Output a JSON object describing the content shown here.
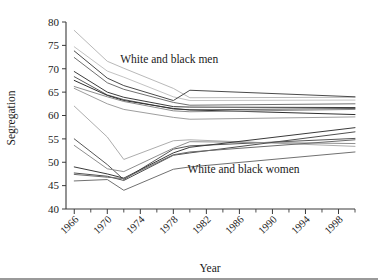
{
  "chart_data": {
    "type": "line",
    "title": "",
    "xlabel": "Year",
    "ylabel": "Segregation",
    "xlim": [
      1965,
      2000
    ],
    "ylim": [
      40,
      80
    ],
    "yticks": [
      40,
      45,
      50,
      55,
      60,
      65,
      70,
      75,
      80
    ],
    "xticks": [
      1966,
      1970,
      1974,
      1978,
      1982,
      1986,
      1990,
      1994,
      1998
    ],
    "xminor_step": 2,
    "grid": false,
    "legend": "none",
    "annotations": [
      {
        "text": "White and black men",
        "x": 1977.5,
        "y": 71.2
      },
      {
        "text": "White and black women",
        "x": 1986.5,
        "y": 47.6
      }
    ],
    "x": [
      1966,
      1970,
      1972,
      1978,
      1980,
      2000
    ],
    "series": [
      {
        "name": "men-1",
        "group": "White and black men",
        "color": "#b9b9b9",
        "width": 1.0,
        "values": [
          78.2,
          71.6,
          70.1,
          65.8,
          63.8,
          63.9
        ]
      },
      {
        "name": "men-2",
        "group": "White and black men",
        "color": "#c3c3c3",
        "width": 1.0,
        "values": [
          74.7,
          69.5,
          68.2,
          64.0,
          63.2,
          63.3
        ]
      },
      {
        "name": "men-3",
        "group": "White and black men",
        "color": "#4a4a4a",
        "width": 1.0,
        "values": [
          73.8,
          68.0,
          66.4,
          63.2,
          65.4,
          64.0
        ]
      },
      {
        "name": "men-4",
        "group": "White and black men",
        "color": "#707070",
        "width": 1.0,
        "values": [
          72.4,
          67.0,
          65.6,
          62.8,
          62.2,
          62.5
        ]
      },
      {
        "name": "men-5",
        "group": "White and black men",
        "color": "#3d3d3d",
        "width": 1.0,
        "values": [
          69.4,
          65.0,
          63.9,
          61.9,
          61.8,
          61.7
        ]
      },
      {
        "name": "men-6",
        "group": "White and black men",
        "color": "#5a5a5a",
        "width": 1.0,
        "values": [
          68.3,
          64.4,
          63.4,
          61.4,
          61.2,
          61.5
        ]
      },
      {
        "name": "men-7",
        "group": "White and black men",
        "color": "#2f2f2f",
        "width": 1.0,
        "values": [
          67.5,
          64.3,
          63.2,
          61.5,
          61.2,
          60.2
        ]
      },
      {
        "name": "men-8",
        "group": "White and black men",
        "color": "#8c8c8c",
        "width": 1.0,
        "values": [
          66.2,
          64.0,
          63.0,
          61.0,
          60.8,
          61.3
        ]
      },
      {
        "name": "men-9",
        "group": "White and black men",
        "color": "#9e9e9e",
        "width": 1.0,
        "values": [
          65.8,
          62.5,
          61.3,
          59.6,
          59.2,
          59.7
        ]
      },
      {
        "name": "men-10",
        "group": "White and black men",
        "color": "#adadad",
        "width": 1.0,
        "values": [
          62.0,
          55.4,
          50.6,
          54.6,
          54.8,
          53.4
        ]
      },
      {
        "name": "women-1",
        "group": "White and black women",
        "color": "#565656",
        "width": 1.0,
        "values": [
          55.0,
          49.5,
          46.3,
          52.8,
          53.5,
          55.1
        ]
      },
      {
        "name": "women-2",
        "group": "White and black women",
        "color": "#8f8f8f",
        "width": 1.0,
        "values": [
          53.6,
          48.6,
          48.0,
          53.0,
          54.4,
          54.0
        ]
      },
      {
        "name": "women-3",
        "group": "White and black women",
        "color": "#3a3a3a",
        "width": 1.0,
        "values": [
          49.0,
          47.5,
          46.6,
          52.0,
          53.2,
          57.4
        ]
      },
      {
        "name": "women-4",
        "group": "White and black women",
        "color": "#4f4f4f",
        "width": 1.0,
        "values": [
          47.7,
          47.0,
          46.1,
          51.5,
          52.0,
          56.5
        ]
      },
      {
        "name": "women-5",
        "group": "White and black women",
        "color": "#6b6b6b",
        "width": 1.0,
        "values": [
          47.4,
          46.8,
          46.5,
          51.6,
          52.2,
          54.8
        ]
      },
      {
        "name": "women-6",
        "group": "White and black women",
        "color": "#717171",
        "width": 1.0,
        "values": [
          46.0,
          46.3,
          44.0,
          48.5,
          49.0,
          52.2
        ]
      }
    ]
  },
  "axes": {
    "ylabel": "Segregation",
    "xlabel": "Year",
    "ytick_labels": [
      "80",
      "75",
      "70",
      "65",
      "60",
      "55",
      "50",
      "45",
      "40"
    ],
    "xtick_labels": [
      "1966",
      "1970",
      "1974",
      "1978",
      "1982",
      "1986",
      "1990",
      "1994",
      "1998"
    ]
  },
  "annotations": {
    "men": "White and black men",
    "women": "White and black women"
  }
}
